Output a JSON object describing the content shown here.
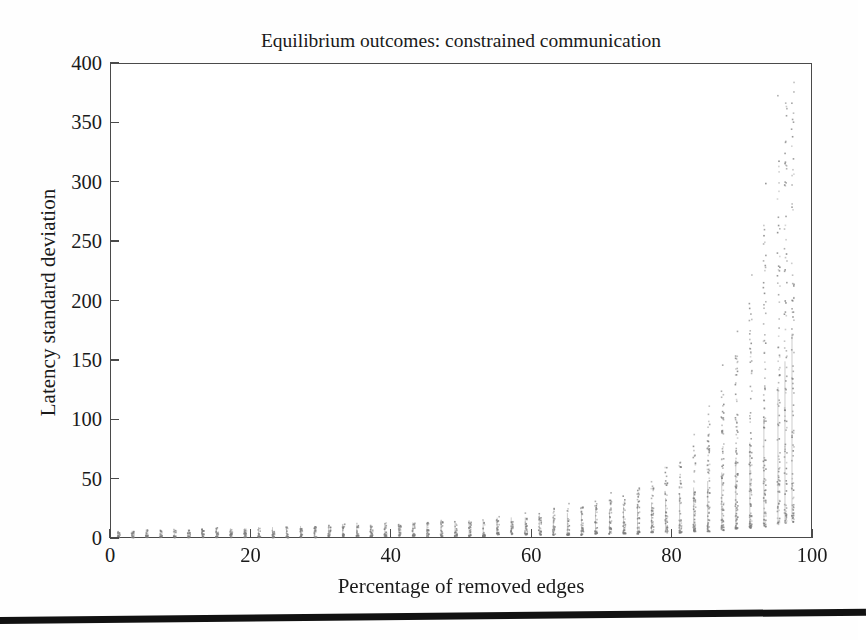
{
  "chart_data": {
    "type": "scatter",
    "title": "Equilibrium outcomes: constrained communication",
    "xlabel": "Percentage of removed edges",
    "ylabel": "Latency standard deviation",
    "xlim": [
      0,
      100
    ],
    "ylim": [
      0,
      400
    ],
    "xticks": [
      0,
      20,
      40,
      60,
      80,
      100
    ],
    "yticks": [
      0,
      50,
      100,
      150,
      200,
      250,
      300,
      350,
      400
    ],
    "grid": false,
    "legend": null,
    "marker": {
      "shape": "dot",
      "color": "#9a9a9a",
      "size_px": 1.6
    },
    "series": [
      {
        "name": "Latency standard deviation samples",
        "columns": [
          {
            "x": 1,
            "median": 4,
            "low": 2,
            "high": 7
          },
          {
            "x": 3,
            "median": 4,
            "low": 2,
            "high": 7
          },
          {
            "x": 5,
            "median": 4,
            "low": 2,
            "high": 8
          },
          {
            "x": 7,
            "median": 4,
            "low": 2,
            "high": 8
          },
          {
            "x": 9,
            "median": 4,
            "low": 2,
            "high": 8
          },
          {
            "x": 11,
            "median": 5,
            "low": 2,
            "high": 8
          },
          {
            "x": 13,
            "median": 5,
            "low": 2,
            "high": 9
          },
          {
            "x": 15,
            "median": 5,
            "low": 2,
            "high": 9
          },
          {
            "x": 17,
            "median": 5,
            "low": 2,
            "high": 9
          },
          {
            "x": 19,
            "median": 5,
            "low": 2,
            "high": 9
          },
          {
            "x": 21,
            "median": 5,
            "low": 2,
            "high": 10
          },
          {
            "x": 23,
            "median": 5,
            "low": 2,
            "high": 10
          },
          {
            "x": 25,
            "median": 6,
            "low": 2,
            "high": 10
          },
          {
            "x": 27,
            "median": 6,
            "low": 2,
            "high": 11
          },
          {
            "x": 29,
            "median": 6,
            "low": 2,
            "high": 11
          },
          {
            "x": 31,
            "median": 6,
            "low": 3,
            "high": 11
          },
          {
            "x": 33,
            "median": 6,
            "low": 3,
            "high": 12
          },
          {
            "x": 35,
            "median": 6,
            "low": 3,
            "high": 12
          },
          {
            "x": 37,
            "median": 7,
            "low": 3,
            "high": 12
          },
          {
            "x": 39,
            "median": 7,
            "low": 3,
            "high": 13
          },
          {
            "x": 41,
            "median": 7,
            "low": 3,
            "high": 13
          },
          {
            "x": 43,
            "median": 7,
            "low": 3,
            "high": 14
          },
          {
            "x": 45,
            "median": 7,
            "low": 3,
            "high": 14
          },
          {
            "x": 47,
            "median": 8,
            "low": 3,
            "high": 15
          },
          {
            "x": 49,
            "median": 8,
            "low": 3,
            "high": 15
          },
          {
            "x": 51,
            "median": 8,
            "low": 3,
            "high": 16
          },
          {
            "x": 53,
            "median": 8,
            "low": 3,
            "high": 17
          },
          {
            "x": 55,
            "median": 9,
            "low": 4,
            "high": 18
          },
          {
            "x": 57,
            "median": 9,
            "low": 4,
            "high": 19
          },
          {
            "x": 59,
            "median": 9,
            "low": 4,
            "high": 20
          },
          {
            "x": 61,
            "median": 10,
            "low": 4,
            "high": 22
          },
          {
            "x": 63,
            "median": 10,
            "low": 4,
            "high": 24
          },
          {
            "x": 65,
            "median": 11,
            "low": 4,
            "high": 26
          },
          {
            "x": 67,
            "median": 11,
            "low": 4,
            "high": 28
          },
          {
            "x": 69,
            "median": 12,
            "low": 5,
            "high": 31
          },
          {
            "x": 71,
            "median": 13,
            "low": 5,
            "high": 34
          },
          {
            "x": 73,
            "median": 14,
            "low": 5,
            "high": 38
          },
          {
            "x": 75,
            "median": 15,
            "low": 5,
            "high": 43
          },
          {
            "x": 77,
            "median": 16,
            "low": 6,
            "high": 49
          },
          {
            "x": 79,
            "median": 18,
            "low": 6,
            "high": 57
          },
          {
            "x": 81,
            "median": 20,
            "low": 6,
            "high": 68
          },
          {
            "x": 83,
            "median": 23,
            "low": 7,
            "high": 82
          },
          {
            "x": 85,
            "median": 26,
            "low": 7,
            "high": 100
          },
          {
            "x": 87,
            "median": 30,
            "low": 8,
            "high": 125
          },
          {
            "x": 89,
            "median": 36,
            "low": 9,
            "high": 160
          },
          {
            "x": 91,
            "median": 44,
            "low": 10,
            "high": 205
          },
          {
            "x": 93,
            "median": 55,
            "low": 11,
            "high": 265
          },
          {
            "x": 95,
            "median": 70,
            "low": 13,
            "high": 330
          },
          {
            "x": 96,
            "median": 82,
            "low": 14,
            "high": 370
          },
          {
            "x": 97,
            "median": 95,
            "low": 15,
            "high": 392
          }
        ]
      }
    ]
  },
  "axis": {
    "ytick_labels": [
      "400",
      "350",
      "300",
      "250",
      "200",
      "150",
      "100",
      "50",
      "0"
    ],
    "xtick_labels": [
      "0",
      "20",
      "40",
      "60",
      "80",
      "100"
    ]
  }
}
